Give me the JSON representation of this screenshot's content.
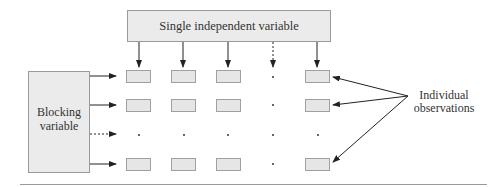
{
  "diagram": {
    "independent_variable_label": "Single independent variable",
    "blocking_variable_label_line1": "Blocking",
    "blocking_variable_label_line2": "variable",
    "observations_label_line1": "Individual",
    "observations_label_line2": "observations",
    "grid": {
      "columns": [
        "cell",
        "cell",
        "cell",
        "dot",
        "cell"
      ],
      "rows": [
        "cells",
        "cells",
        "dots",
        "cells"
      ]
    },
    "colors": {
      "box_fill": "#ebebeb",
      "box_border": "#9a9a9a",
      "arrow": "#222222",
      "text": "#333333"
    }
  }
}
